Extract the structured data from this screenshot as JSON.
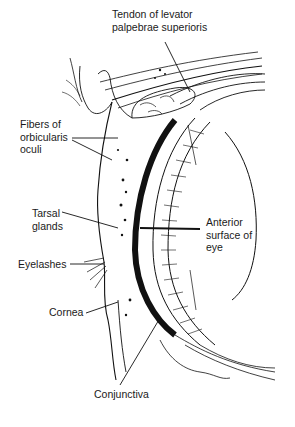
{
  "figure": {
    "ink_color": "#111111",
    "background": "#ffffff",
    "labels": [
      {
        "id": "levator",
        "text": "Tendon of levator\npalpebrae superioris"
      },
      {
        "id": "orbicularis",
        "text": "Fibers of\norbicularis\noculi"
      },
      {
        "id": "tarsal",
        "text": "Tarsal\nglands"
      },
      {
        "id": "anterior",
        "text": "Anterior\nsurface of\neye"
      },
      {
        "id": "eyelashes",
        "text": "Eyelashes"
      },
      {
        "id": "cornea",
        "text": "Cornea"
      },
      {
        "id": "conjunctiva",
        "text": "Conjunctiva"
      }
    ]
  }
}
